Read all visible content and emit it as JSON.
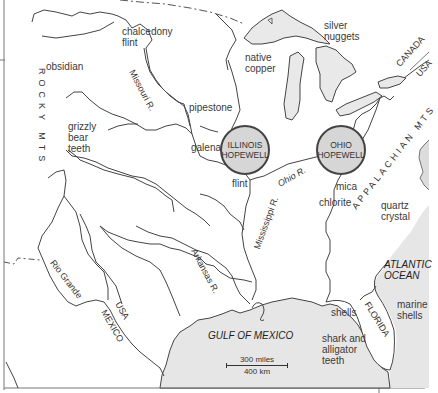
{
  "map": {
    "title": "Hopewell Interaction Sphere trade materials",
    "centers": [
      {
        "line1": "ILLINOIS",
        "line2": "HOPEWELL"
      },
      {
        "line1": "OHIO",
        "line2": "HOPEWELL"
      }
    ],
    "resources": {
      "chalcedony_flint": "chalcedony\nflint",
      "obsidian": "obsidian",
      "grizzly_bear_teeth": "grizzly\nbear\nteeth",
      "pipestone": "pipestone",
      "galena": "galena",
      "flint": "flint",
      "native_copper": "native\ncopper",
      "silver_nuggets": "silver\nnuggets",
      "mica": "mica",
      "chlorite": "chlorite",
      "quartz_crystal": "quartz\ncrystal",
      "shells": "shells",
      "shark_alligator_teeth": "shark and\nalligator\nteeth",
      "marine_shells": "marine\nshells"
    },
    "rivers": {
      "missouri": "Missouri R.",
      "ohio": "Ohio R.",
      "mississippi": "Mississippi R.",
      "arkansas": "Arkansas R.",
      "rio_grande": "Rio Grande"
    },
    "regions": {
      "rocky_mts": "ROCKY MTS",
      "appalachian_mts": "APPALACHIAN MTS",
      "canada": "CANADA",
      "usa_north": "USA",
      "usa_south": "USA",
      "mexico": "MEXICO",
      "florida": "FLORIDA"
    },
    "water": {
      "atlantic": "ATLANTIC\nOCEAN",
      "gulf": "GULF OF MEXICO"
    },
    "scale": {
      "miles": "300 miles",
      "km": "400 km"
    },
    "colors": {
      "water": "#e6e6e6",
      "lakes": "#e9e9e9",
      "circle_fill": "#d6d6d6",
      "line": "#444444",
      "land": "#ffffff"
    }
  }
}
